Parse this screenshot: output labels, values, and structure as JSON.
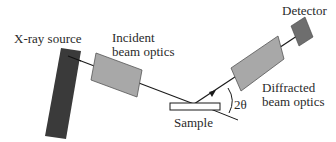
{
  "diagram": {
    "labels": {
      "xray_source": "X-ray source",
      "incident_line1": "Incident",
      "incident_line2": "beam optics",
      "detector": "Detector",
      "diffracted_line1": "Diffracted",
      "diffracted_line2": "beam optics",
      "sample": "Sample",
      "angle": "2θ"
    },
    "colors": {
      "source": "#3a3a3a",
      "optics": "#a8a8a8",
      "detector": "#6e6e6e",
      "line": "#1a1a1a",
      "sample": "#ffffff"
    }
  }
}
